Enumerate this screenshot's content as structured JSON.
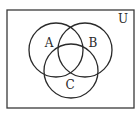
{
  "diagram": {
    "type": "venn",
    "universe_label": "U",
    "sets": [
      {
        "label": "A",
        "cx": 56,
        "cy": 50,
        "r": 27,
        "label_x": 49,
        "label_y": 47
      },
      {
        "label": "B",
        "cx": 85,
        "cy": 50,
        "r": 27,
        "label_x": 93,
        "label_y": 47
      },
      {
        "label": "C",
        "cx": 71,
        "cy": 71,
        "r": 27,
        "label_x": 70,
        "label_y": 89
      }
    ],
    "universe_rect": {
      "x": 7,
      "y": 10,
      "w": 127,
      "h": 98
    },
    "universe_label_pos": {
      "x": 123,
      "y": 23
    },
    "stroke_color": "#2a2a2a"
  }
}
